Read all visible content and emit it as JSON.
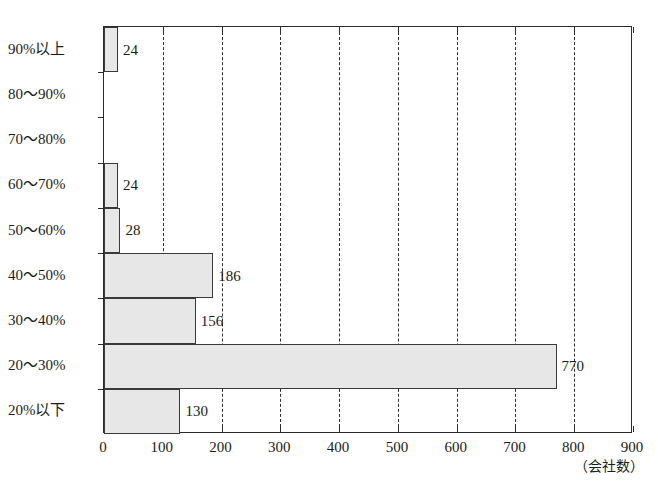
{
  "chart_data": {
    "type": "bar",
    "orientation": "horizontal",
    "title": "",
    "xlabel": "",
    "ylabel": "",
    "unit_note": "（会社数）",
    "xlim": [
      0,
      900
    ],
    "xticks": [
      0,
      100,
      200,
      300,
      400,
      500,
      600,
      700,
      800,
      900
    ],
    "xtick_labels": [
      "0",
      "100",
      "200",
      "300",
      "400",
      "500",
      "600",
      "700",
      "800",
      "900"
    ],
    "grid": "vertical-dashed",
    "legend": "none",
    "categories": [
      "90%以上",
      "80〜90%",
      "70〜80%",
      "60〜70%",
      "50〜60%",
      "40〜50%",
      "30〜40%",
      "20〜30%",
      "20%以下"
    ],
    "values": [
      24,
      0,
      0,
      24,
      28,
      186,
      156,
      770,
      130
    ],
    "value_labels": [
      "24",
      "",
      "",
      "24",
      "28",
      "186",
      "156",
      "770",
      "130"
    ],
    "bar_fill": "#e7e7e7",
    "bar_stroke": "#3a3a3a",
    "axis_color": "#2a2a2a",
    "grid_color": "#2f2f2f"
  }
}
